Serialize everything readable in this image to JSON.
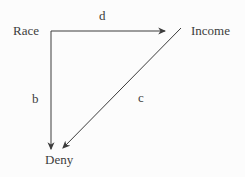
{
  "diagram": {
    "type": "causal-dag",
    "nodes": {
      "race": {
        "label": "Race"
      },
      "income": {
        "label": "Income"
      },
      "deny": {
        "label": "Deny"
      }
    },
    "edges": {
      "race_to_income": {
        "label": "d",
        "from": "race",
        "to": "income"
      },
      "race_to_deny": {
        "label": "b",
        "from": "race",
        "to": "deny"
      },
      "income_to_deny": {
        "label": "c",
        "from": "income",
        "to": "deny"
      }
    }
  },
  "colors": {
    "line": "#3c3c3c",
    "text": "#3c3c3c",
    "background": "#fcfcfc"
  }
}
